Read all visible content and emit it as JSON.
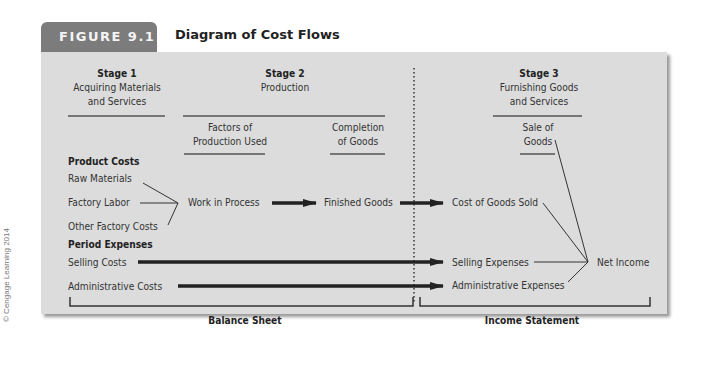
{
  "figure": {
    "tab_label": "FIGURE 9.1",
    "title": "Diagram of Cost Flows",
    "credit": "© Cengage Learning 2014"
  },
  "stages": [
    {
      "label": "Stage 1",
      "lines": [
        "Acquiring Materials",
        "and Services"
      ]
    },
    {
      "label": "Stage 2",
      "lines": [
        "Production"
      ]
    },
    {
      "label": "Stage 3",
      "lines": [
        "Furnishing Goods",
        "and Services"
      ]
    }
  ],
  "subheaders": {
    "factors": [
      "Factors of",
      "Production Used"
    ],
    "completion": [
      "Completion",
      "of Goods"
    ],
    "sale": [
      "Sale of",
      "Goods"
    ]
  },
  "product_costs": {
    "heading": "Product Costs",
    "items": [
      "Raw Materials",
      "Factory Labor",
      "Other Factory Costs"
    ]
  },
  "period_expenses": {
    "heading": "Period Expenses",
    "items": [
      "Selling Costs",
      "Administrative Costs"
    ]
  },
  "flow_nodes": {
    "work_in_process": "Work in Process",
    "finished_goods": "Finished Goods",
    "cost_of_goods_sold": "Cost of Goods Sold",
    "selling_expenses": "Selling Expenses",
    "administrative_expenses": "Administrative Expenses",
    "net_income": "Net Income"
  },
  "statements": {
    "balance_sheet": "Balance Sheet",
    "income_statement": "Income Statement"
  },
  "colors": {
    "tab_bg": "#7c7c7c",
    "panel_bg": "#dcdcdc",
    "line": "#222222"
  }
}
